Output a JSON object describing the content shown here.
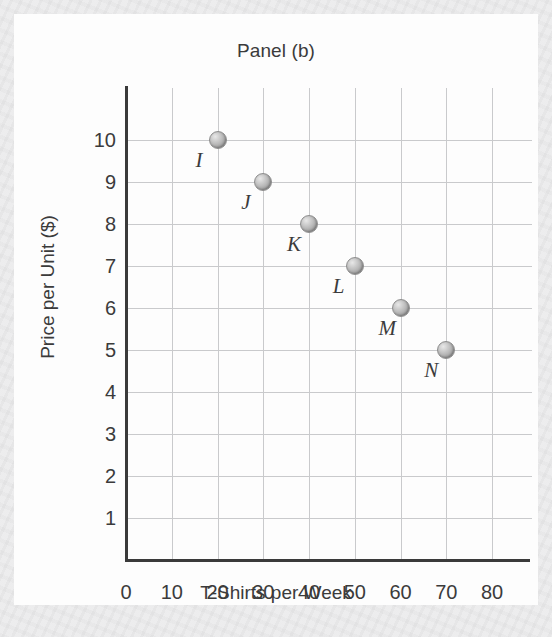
{
  "chart_data": {
    "type": "scatter",
    "title": "Panel (b)",
    "xlabel": "T-Shirts per Week",
    "ylabel": "Price per Unit ($)",
    "xlim": [
      0,
      80
    ],
    "ylim": [
      0,
      10
    ],
    "xticks": [
      "0",
      "10",
      "20",
      "30",
      "40",
      "50",
      "60",
      "70",
      "80"
    ],
    "yticks": [
      "1",
      "2",
      "3",
      "4",
      "5",
      "6",
      "7",
      "8",
      "9",
      "10"
    ],
    "grid": true,
    "legend": "none",
    "marker_color": "#b4b4b4",
    "axis_color": "#3a3a3a",
    "grid_color": "#c9cacc",
    "points": [
      {
        "label": "I",
        "x": 20,
        "y": 10
      },
      {
        "label": "J",
        "x": 30,
        "y": 9
      },
      {
        "label": "K",
        "x": 40,
        "y": 8
      },
      {
        "label": "L",
        "x": 50,
        "y": 7
      },
      {
        "label": "M",
        "x": 60,
        "y": 6
      },
      {
        "label": "N",
        "x": 70,
        "y": 5
      }
    ]
  }
}
